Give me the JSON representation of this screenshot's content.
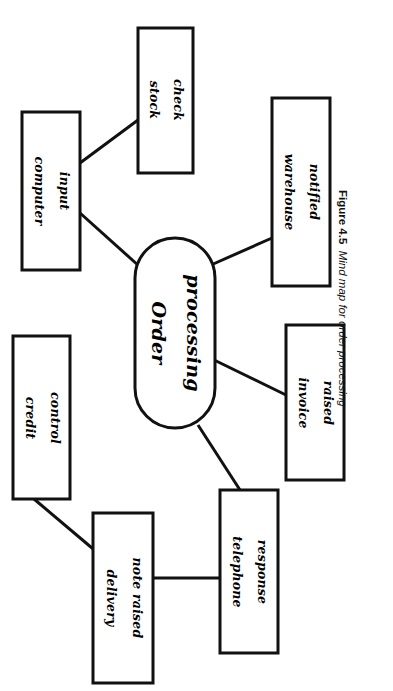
{
  "page": {
    "running_header": "THE INFORMATION AND KNOWLEDGE-BASED PROCESSES",
    "background_color": "#ffffff",
    "ink_color": "#111111",
    "width": 393,
    "height": 691
  },
  "figure": {
    "number_label": "Figure 4.5",
    "caption_text": "Mind map for order processing",
    "orientation": "rotated-90-clockwise"
  },
  "diagram": {
    "type": "mind-map",
    "central_node": {
      "id": "order-processing",
      "label_line1": "Order",
      "label_line2": "processing",
      "shape": "stadium",
      "x": 135,
      "y": 238,
      "width": 80,
      "height": 190
    },
    "nodes": [
      {
        "id": "stock-check",
        "label_line1": "stock",
        "label_line2": "check",
        "shape": "rectangle",
        "x": 138,
        "y": 28,
        "width": 55,
        "height": 145
      },
      {
        "id": "computer-input",
        "label_line1": "computer",
        "label_line2": "input",
        "shape": "rectangle",
        "x": 22,
        "y": 112,
        "width": 58,
        "height": 158
      },
      {
        "id": "warehouse-notified",
        "label_line1": "warehouse",
        "label_line2": "notified",
        "shape": "rectangle",
        "x": 272,
        "y": 98,
        "width": 58,
        "height": 188
      },
      {
        "id": "invoice-raised",
        "label_line1": "invoice",
        "label_line2": "raised",
        "shape": "rectangle",
        "x": 286,
        "y": 325,
        "width": 58,
        "height": 155
      },
      {
        "id": "credit-control",
        "label_line1": "credit",
        "label_line2": "control",
        "shape": "rectangle",
        "x": 13,
        "y": 336,
        "width": 57,
        "height": 163
      },
      {
        "id": "telephone-response",
        "label_line1": "telephone",
        "label_line2": "response",
        "shape": "rectangle",
        "x": 220,
        "y": 490,
        "width": 58,
        "height": 163
      },
      {
        "id": "delivery-note-raised",
        "label_line1": "delivery",
        "label_line2": "note raised",
        "shape": "rectangle",
        "x": 93,
        "y": 513,
        "width": 60,
        "height": 170
      }
    ],
    "connections": [
      {
        "from": "computer-input",
        "to": "stock-check"
      },
      {
        "from": "computer-input",
        "to": "order-processing"
      },
      {
        "from": "order-processing",
        "to": "warehouse-notified"
      },
      {
        "from": "order-processing",
        "to": "invoice-raised"
      },
      {
        "from": "order-processing",
        "to": "telephone-response"
      },
      {
        "from": "telephone-response",
        "to": "delivery-note-raised"
      },
      {
        "from": "delivery-note-raised",
        "to": "credit-control"
      }
    ]
  }
}
